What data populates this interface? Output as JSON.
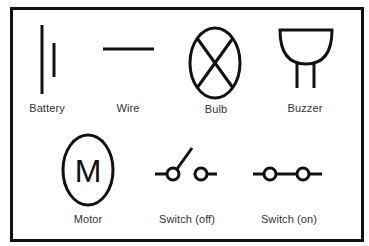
{
  "diagram": {
    "colors": {
      "stroke": "#111111",
      "label": "#333333",
      "background": "#ffffff"
    },
    "symbols": [
      {
        "id": "battery",
        "label": "Battery",
        "icon": "battery-icon"
      },
      {
        "id": "wire",
        "label": "Wire",
        "icon": "wire-icon"
      },
      {
        "id": "bulb",
        "label": "Bulb",
        "icon": "bulb-icon"
      },
      {
        "id": "buzzer",
        "label": "Buzzer",
        "icon": "buzzer-icon"
      },
      {
        "id": "motor",
        "label": "Motor",
        "icon": "motor-icon",
        "glyph": "M"
      },
      {
        "id": "switch-off",
        "label": "Switch (off)",
        "icon": "switch-open-icon"
      },
      {
        "id": "switch-on",
        "label": "Switch (on)",
        "icon": "switch-closed-icon"
      }
    ]
  }
}
